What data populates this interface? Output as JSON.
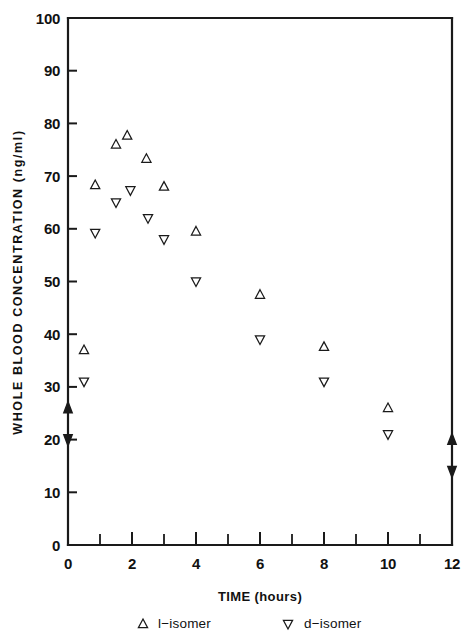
{
  "chart_data": {
    "type": "scatter",
    "title": "",
    "xlabel": "TIME (hours)",
    "ylabel": "WHOLE BLOOD CONCENTRATION (ng/ml)",
    "xlim": [
      0,
      12
    ],
    "ylim": [
      0,
      100
    ],
    "xticks": [
      0,
      2,
      4,
      6,
      8,
      10,
      12
    ],
    "xtick_labels": [
      "0",
      "2",
      "4",
      "6",
      "8",
      "10",
      "12"
    ],
    "xminor_step": 1,
    "yticks": [
      0,
      10,
      20,
      30,
      40,
      50,
      60,
      70,
      80,
      90,
      100
    ],
    "ytick_labels": [
      "0",
      "10",
      "20",
      "30",
      "40",
      "50",
      "60",
      "70",
      "80",
      "90",
      "100"
    ],
    "grid": false,
    "legend_position": "below-axis",
    "series": [
      {
        "name": "l-isomer",
        "marker": "triangle-up",
        "points": [
          {
            "x": 0.5,
            "y": 37.0
          },
          {
            "x": 0.85,
            "y": 68.3
          },
          {
            "x": 1.5,
            "y": 76.0
          },
          {
            "x": 1.85,
            "y": 77.7
          },
          {
            "x": 2.45,
            "y": 73.3
          },
          {
            "x": 3.0,
            "y": 68.0
          },
          {
            "x": 4.0,
            "y": 59.5
          },
          {
            "x": 6.0,
            "y": 47.5
          },
          {
            "x": 8.0,
            "y": 37.6
          },
          {
            "x": 10.0,
            "y": 26.0
          }
        ]
      },
      {
        "name": "d-isomer",
        "marker": "triangle-down",
        "points": [
          {
            "x": 0.5,
            "y": 31.0
          },
          {
            "x": 0.85,
            "y": 59.2
          },
          {
            "x": 1.5,
            "y": 65.0
          },
          {
            "x": 1.95,
            "y": 67.3
          },
          {
            "x": 2.5,
            "y": 62.0
          },
          {
            "x": 3.0,
            "y": 58.0
          },
          {
            "x": 4.0,
            "y": 50.0
          },
          {
            "x": 6.0,
            "y": 39.0
          },
          {
            "x": 8.0,
            "y": 31.0
          },
          {
            "x": 10.0,
            "y": 21.0
          }
        ]
      }
    ],
    "annotations": [
      {
        "name": "left-axis-arrow",
        "axis": "left",
        "y": 23.0,
        "style": "double-headed-arrow"
      },
      {
        "name": "right-axis-arrow",
        "axis": "right",
        "y": 17.0,
        "style": "double-headed-arrow"
      }
    ]
  },
  "legend": {
    "entries": [
      {
        "marker": "triangle-up",
        "label": "l−isomer"
      },
      {
        "marker": "triangle-down",
        "label": "d−isomer"
      }
    ]
  }
}
